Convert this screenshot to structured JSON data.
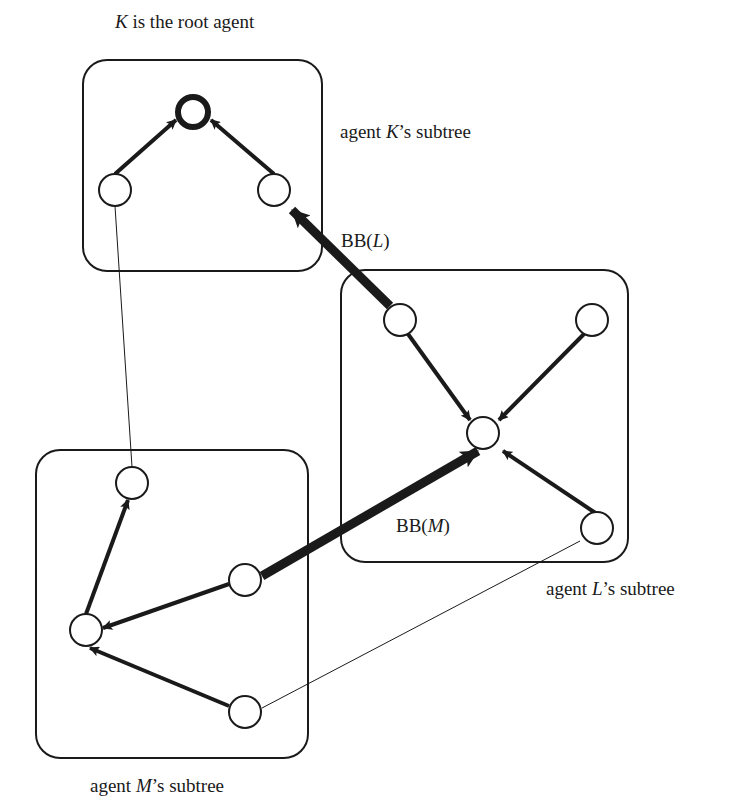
{
  "title_label": {
    "var": "K",
    "text": " is the root agent"
  },
  "subtrees": [
    {
      "id": "K",
      "label_prefix": "agent ",
      "var": "K",
      "label_suffix": "’s subtree"
    },
    {
      "id": "L",
      "label_prefix": "agent ",
      "var": "L",
      "label_suffix": "’s subtree"
    },
    {
      "id": "M",
      "label_prefix": "agent ",
      "var": "M",
      "label_suffix": "’s subtree"
    }
  ],
  "bridge_labels": [
    {
      "id": "BB_L",
      "prefix": "BB(",
      "var": "L",
      "suffix": ")"
    },
    {
      "id": "BB_M",
      "prefix": "BB(",
      "var": "M",
      "suffix": ")"
    }
  ],
  "nodes": [
    {
      "id": "K0",
      "subtree": "K",
      "role": "root",
      "x": 193,
      "y": 112
    },
    {
      "id": "K1",
      "subtree": "K",
      "x": 115,
      "y": 190
    },
    {
      "id": "K2",
      "subtree": "K",
      "x": 274,
      "y": 190
    },
    {
      "id": "L1",
      "subtree": "L",
      "x": 400,
      "y": 320
    },
    {
      "id": "L2",
      "subtree": "L",
      "x": 592,
      "y": 320
    },
    {
      "id": "L0",
      "subtree": "L",
      "x": 483,
      "y": 433
    },
    {
      "id": "L3",
      "subtree": "L",
      "x": 597,
      "y": 528
    },
    {
      "id": "M1",
      "subtree": "M",
      "x": 132,
      "y": 483
    },
    {
      "id": "M2",
      "subtree": "M",
      "x": 245,
      "y": 580
    },
    {
      "id": "M0",
      "subtree": "M",
      "x": 86,
      "y": 630
    },
    {
      "id": "M3",
      "subtree": "M",
      "x": 245,
      "y": 712
    }
  ],
  "edges": [
    {
      "from": "K1",
      "to": "K0",
      "type": "tree-arrow"
    },
    {
      "from": "K2",
      "to": "K0",
      "type": "tree-arrow"
    },
    {
      "from": "L1",
      "to": "L0",
      "type": "tree-arrow"
    },
    {
      "from": "L2",
      "to": "L0",
      "type": "tree-arrow"
    },
    {
      "from": "L3",
      "to": "L0",
      "type": "tree-arrow"
    },
    {
      "from": "M0",
      "to": "M1",
      "type": "tree-arrow"
    },
    {
      "from": "M2",
      "to": "M0",
      "type": "tree-arrow"
    },
    {
      "from": "M3",
      "to": "M0",
      "type": "tree-arrow"
    },
    {
      "from": "L1",
      "to": "K2",
      "type": "bridge-arrow",
      "label": "BB(L)"
    },
    {
      "from": "M2",
      "to": "L0",
      "type": "bridge-arrow",
      "label": "BB(M)"
    },
    {
      "from": "K1",
      "to": "M1",
      "type": "thin-link"
    },
    {
      "from": "L3",
      "to": "M3",
      "type": "thin-link"
    }
  ],
  "colors": {
    "stroke": "#1a1a1a",
    "background": "#ffffff"
  }
}
